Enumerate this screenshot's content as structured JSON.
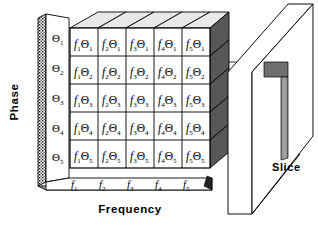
{
  "figure": {
    "axes": {
      "vertical": {
        "caption": "Phase",
        "symbol": "Θ",
        "ticks": [
          "Θ1",
          "Θ2",
          "Θ3",
          "Θ4",
          "Θ5"
        ],
        "tick_bases": [
          "Θ",
          "Θ",
          "Θ",
          "Θ",
          "Θ"
        ],
        "tick_subs": [
          "1",
          "2",
          "3",
          "4",
          "5"
        ]
      },
      "horizontal": {
        "caption": "Frequency",
        "symbol": "f",
        "ticks": [
          "f1",
          "f2",
          "f3",
          "f4",
          "f5"
        ],
        "tick_bases": [
          "f",
          "f",
          "f",
          "f",
          "f"
        ],
        "tick_subs": [
          "1",
          "2",
          "3",
          "4",
          "5"
        ]
      }
    },
    "slice": {
      "caption": "Slice"
    },
    "matrix": {
      "rows": 5,
      "cols": 5,
      "cells": [
        [
          {
            "f": "f",
            "fs": "1",
            "t": "Θ",
            "ts": "1"
          },
          {
            "f": "f",
            "fs": "2",
            "t": "Θ",
            "ts": "1"
          },
          {
            "f": "f",
            "fs": "3",
            "t": "Θ",
            "ts": "1"
          },
          {
            "f": "f",
            "fs": "4",
            "t": "Θ",
            "ts": "1"
          },
          {
            "f": "f",
            "fs": "5",
            "t": "Θ",
            "ts": "1"
          }
        ],
        [
          {
            "f": "f",
            "fs": "1",
            "t": "Θ",
            "ts": "2"
          },
          {
            "f": "f",
            "fs": "2",
            "t": "Θ",
            "ts": "2"
          },
          {
            "f": "f",
            "fs": "3",
            "t": "Θ",
            "ts": "2"
          },
          {
            "f": "f",
            "fs": "4",
            "t": "Θ",
            "ts": "2"
          },
          {
            "f": "f",
            "fs": "5",
            "t": "Θ",
            "ts": "2"
          }
        ],
        [
          {
            "f": "f",
            "fs": "1",
            "t": "Θ",
            "ts": "3"
          },
          {
            "f": "f",
            "fs": "2",
            "t": "Θ",
            "ts": "3"
          },
          {
            "f": "f",
            "fs": "3",
            "t": "Θ",
            "ts": "3"
          },
          {
            "f": "f",
            "fs": "4",
            "t": "Θ",
            "ts": "3"
          },
          {
            "f": "f",
            "fs": "5",
            "t": "Θ",
            "ts": "3"
          }
        ],
        [
          {
            "f": "f",
            "fs": "1",
            "t": "Θ",
            "ts": "4"
          },
          {
            "f": "f",
            "fs": "2",
            "t": "Θ",
            "ts": "4"
          },
          {
            "f": "f",
            "fs": "3",
            "t": "Θ",
            "ts": "4"
          },
          {
            "f": "f",
            "fs": "4",
            "t": "Θ",
            "ts": "4"
          },
          {
            "f": "f",
            "fs": "5",
            "t": "Θ",
            "ts": "4"
          }
        ],
        [
          {
            "f": "f",
            "fs": "1",
            "t": "Θ",
            "ts": "5"
          },
          {
            "f": "f",
            "fs": "2",
            "t": "Θ",
            "ts": "5"
          },
          {
            "f": "f",
            "fs": "3",
            "t": "Θ",
            "ts": "5"
          },
          {
            "f": "f",
            "fs": "4",
            "t": "Θ",
            "ts": "5"
          },
          {
            "f": "f",
            "fs": "5",
            "t": "Θ",
            "ts": "5"
          }
        ]
      ]
    },
    "colors": {
      "stroke": "#000000",
      "face_front": "#ffffff",
      "face_top": "#e9e9e9",
      "face_right": "#585858",
      "slice_strip": "#9a9a9a",
      "slice_corner": "#6e6e6e",
      "panel": "#ffffff",
      "panel_edge": "#1a1a1a"
    }
  }
}
